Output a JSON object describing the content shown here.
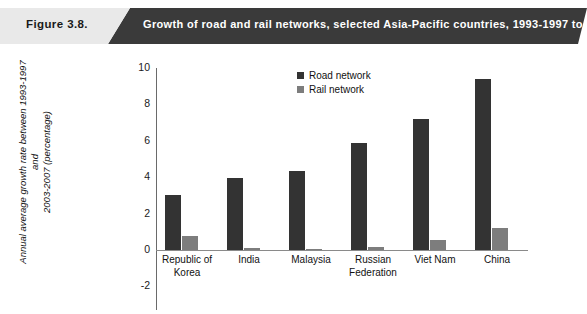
{
  "header": {
    "figure_number": "Figure  3.8.",
    "title": "Growth of road and rail networks, selected Asia-Pacific countries, 1993-1997 to 2003-2007",
    "light_bg": "#e9e9e9",
    "dark_bg": "#3a3a3a",
    "title_color": "#ffffff",
    "number_color": "#1a1a1a"
  },
  "chart_data": {
    "type": "bar",
    "title": "Growth of road and rail networks, selected Asia-Pacific countries, 1993-1997 to 2003-2007",
    "xlabel": "",
    "ylabel_line1": "Annual average growth rate between 1993-1997 and",
    "ylabel_line2": "2003-2007 (percentage)",
    "categories": [
      "Republic of\nKorea",
      "India",
      "Malaysia",
      "Russian\nFederation",
      "Viet Nam",
      "China"
    ],
    "categories_lines": [
      [
        "Republic of",
        "Korea"
      ],
      [
        "India"
      ],
      [
        "Malaysia"
      ],
      [
        "Russian",
        "Federation"
      ],
      [
        "Viet Nam"
      ],
      [
        "China"
      ]
    ],
    "series": [
      {
        "name": "Road network",
        "color": "#333333",
        "values": [
          3.0,
          3.95,
          4.35,
          5.9,
          7.2,
          9.4
        ]
      },
      {
        "name": "Rail network",
        "color": "#7d7d7d",
        "values": [
          0.77,
          0.1,
          0.05,
          0.15,
          0.55,
          1.2
        ]
      }
    ],
    "ylim": [
      -2,
      10
    ],
    "yticks": [
      10,
      8,
      6,
      4,
      2,
      0,
      -2
    ],
    "ytick_labels": [
      "10",
      "8",
      "6",
      "4",
      "2",
      "0",
      "-2"
    ],
    "grid": false,
    "legend_position": "top-center"
  }
}
